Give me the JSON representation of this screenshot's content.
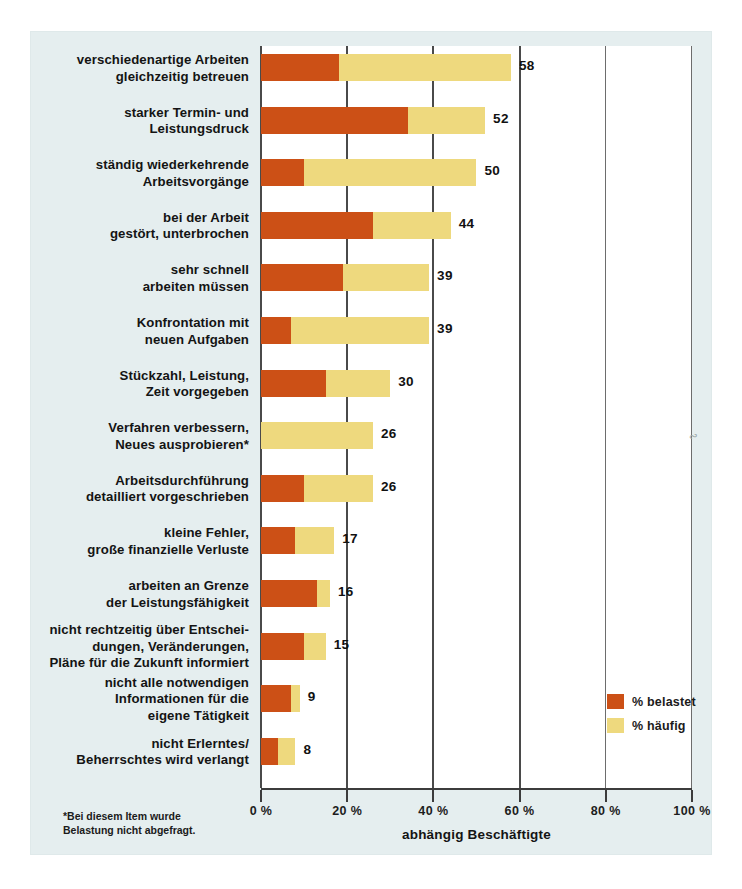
{
  "chart_data": {
    "type": "bar",
    "orientation": "horizontal",
    "stacked": true,
    "title": "",
    "xlabel": "abhängig Beschäftigte",
    "ylabel": "",
    "xlim": [
      0,
      100
    ],
    "xticks": [
      "0 %",
      "20 %",
      "40 %",
      "60 %",
      "80 %",
      "100 %"
    ],
    "xtick_values": [
      0,
      20,
      40,
      60,
      80,
      100
    ],
    "grid": true,
    "grid_axis": "x",
    "legend_position": "bottom-right",
    "series": [
      {
        "name": "% belastet",
        "color": "#cc5016",
        "values": [
          18,
          34,
          10,
          26,
          19,
          7,
          15,
          0,
          10,
          8,
          13,
          10,
          7,
          4
        ]
      },
      {
        "name": "% häufig",
        "color": "#eed97e",
        "values": [
          58,
          52,
          50,
          44,
          39,
          39,
          30,
          26,
          26,
          17,
          16,
          15,
          9,
          8
        ]
      }
    ],
    "categories": [
      "verschiedenartige Arbeiten gleichzeitig betreuen",
      "starker Termin- und Leistungsdruck",
      "ständig wiederkehrende Arbeitsvorgänge",
      "bei der Arbeit gestört, unterbrochen",
      "sehr schnell arbeiten müssen",
      "Konfrontation mit neuen Aufgaben",
      "Stückzahl, Leistung, Zeit vorgegeben",
      "Verfahren verbessern, Neues ausprobieren*",
      "Arbeitsdurchführung detailliert vorgeschrieben",
      "kleine Fehler, große finanzielle Verluste",
      "arbeiten an Grenze der Leistungsfähigkeit",
      "nicht rechtzeitig über Entscheidungen, Veränderungen, Pläne für die Zukunft informiert",
      "nicht alle notwendigen Informationen für die eigene Tätigkeit",
      "nicht Erlerntes/ Beherrschtes wird verlangt"
    ],
    "annotations": [
      "*Bei diesem Item wurde Belastung nicht abgefragt."
    ]
  },
  "rows": [
    {
      "label_lines": [
        "verschiedenartige Arbeiten",
        "gleichzeitig betreuen"
      ],
      "belastet": 18,
      "haeufig": 58,
      "value": "58"
    },
    {
      "label_lines": [
        "starker Termin- und",
        "Leistungsdruck"
      ],
      "belastet": 34,
      "haeufig": 52,
      "value": "52"
    },
    {
      "label_lines": [
        "ständig wiederkehrende",
        "Arbeitsvorgänge"
      ],
      "belastet": 10,
      "haeufig": 50,
      "value": "50"
    },
    {
      "label_lines": [
        "bei der Arbeit",
        "gestört, unterbrochen"
      ],
      "belastet": 26,
      "haeufig": 44,
      "value": "44"
    },
    {
      "label_lines": [
        "sehr schnell",
        "arbeiten müssen"
      ],
      "belastet": 19,
      "haeufig": 39,
      "value": "39"
    },
    {
      "label_lines": [
        "Konfrontation mit",
        "neuen Aufgaben"
      ],
      "belastet": 7,
      "haeufig": 39,
      "value": "39"
    },
    {
      "label_lines": [
        "Stückzahl, Leistung,",
        "Zeit vorgegeben"
      ],
      "belastet": 15,
      "haeufig": 30,
      "value": "30"
    },
    {
      "label_lines": [
        "Verfahren verbessern,",
        "Neues ausprobieren*"
      ],
      "belastet": 0,
      "haeufig": 26,
      "value": "26"
    },
    {
      "label_lines": [
        "Arbeitsdurchführung",
        "detailliert vorgeschrieben"
      ],
      "belastet": 10,
      "haeufig": 26,
      "value": "26"
    },
    {
      "label_lines": [
        "kleine Fehler,",
        "große finanzielle Verluste"
      ],
      "belastet": 8,
      "haeufig": 17,
      "value": "17"
    },
    {
      "label_lines": [
        "arbeiten an Grenze",
        "der Leistungsfähigkeit"
      ],
      "belastet": 13,
      "haeufig": 16,
      "value": "16"
    },
    {
      "label_lines": [
        "nicht rechtzeitig über Entschei-",
        "dungen, Veränderungen,",
        "Pläne für die Zukunft informiert"
      ],
      "belastet": 10,
      "haeufig": 15,
      "value": "15"
    },
    {
      "label_lines": [
        "nicht alle notwendigen",
        "Informationen für die",
        "eigene Tätigkeit"
      ],
      "belastet": 7,
      "haeufig": 9,
      "value": "9"
    },
    {
      "label_lines": [
        "nicht Erlerntes/",
        "Beherrschtes wird verlangt"
      ],
      "belastet": 4,
      "haeufig": 8,
      "value": "8"
    }
  ],
  "axis": {
    "ticks": [
      "0 %",
      "20 %",
      "40 %",
      "60 %",
      "80 %",
      "100 %"
    ],
    "title": "abhängig Beschäftigte"
  },
  "legend": {
    "items": [
      {
        "label": "% belastet",
        "color": "#cc5016"
      },
      {
        "label": "% häufig",
        "color": "#eed97e"
      }
    ]
  },
  "footnote": {
    "line1": "*Bei diesem Item wurde",
    "line2": "Belastung nicht abgefragt."
  },
  "colors": {
    "belastet": "#cc5016",
    "haeufig": "#eed97e",
    "background": "#e5eeef",
    "plot": "#ffffff"
  }
}
